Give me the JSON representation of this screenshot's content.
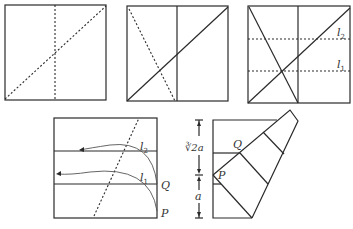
{
  "figure": {
    "panels": [
      {
        "id": 1,
        "lines": [
          "vertical center crease (dashed)",
          "diagonal crease (dashed)"
        ]
      },
      {
        "id": 2,
        "lines": [
          "vertical center crease",
          "diagonal",
          "crease from top-left to bottom midpoint (dashed)"
        ]
      },
      {
        "id": 3,
        "labels": {
          "l2": "l",
          "l2_sub": "2",
          "l1": "l",
          "l1_sub": "1"
        }
      },
      {
        "id": 4,
        "labels": {
          "l2": "l",
          "l2_sub": "2",
          "l1": "l",
          "l1_sub": "1",
          "Q": "Q",
          "P": "P"
        }
      },
      {
        "id": 5,
        "labels": {
          "Q": "Q",
          "P": "P",
          "upper_dim": "∛2a",
          "lower_dim": "a"
        }
      }
    ]
  },
  "colors": {
    "line": "#2a2a2a",
    "curve": "#555555",
    "text": "#333333",
    "background": "#ffffff"
  }
}
